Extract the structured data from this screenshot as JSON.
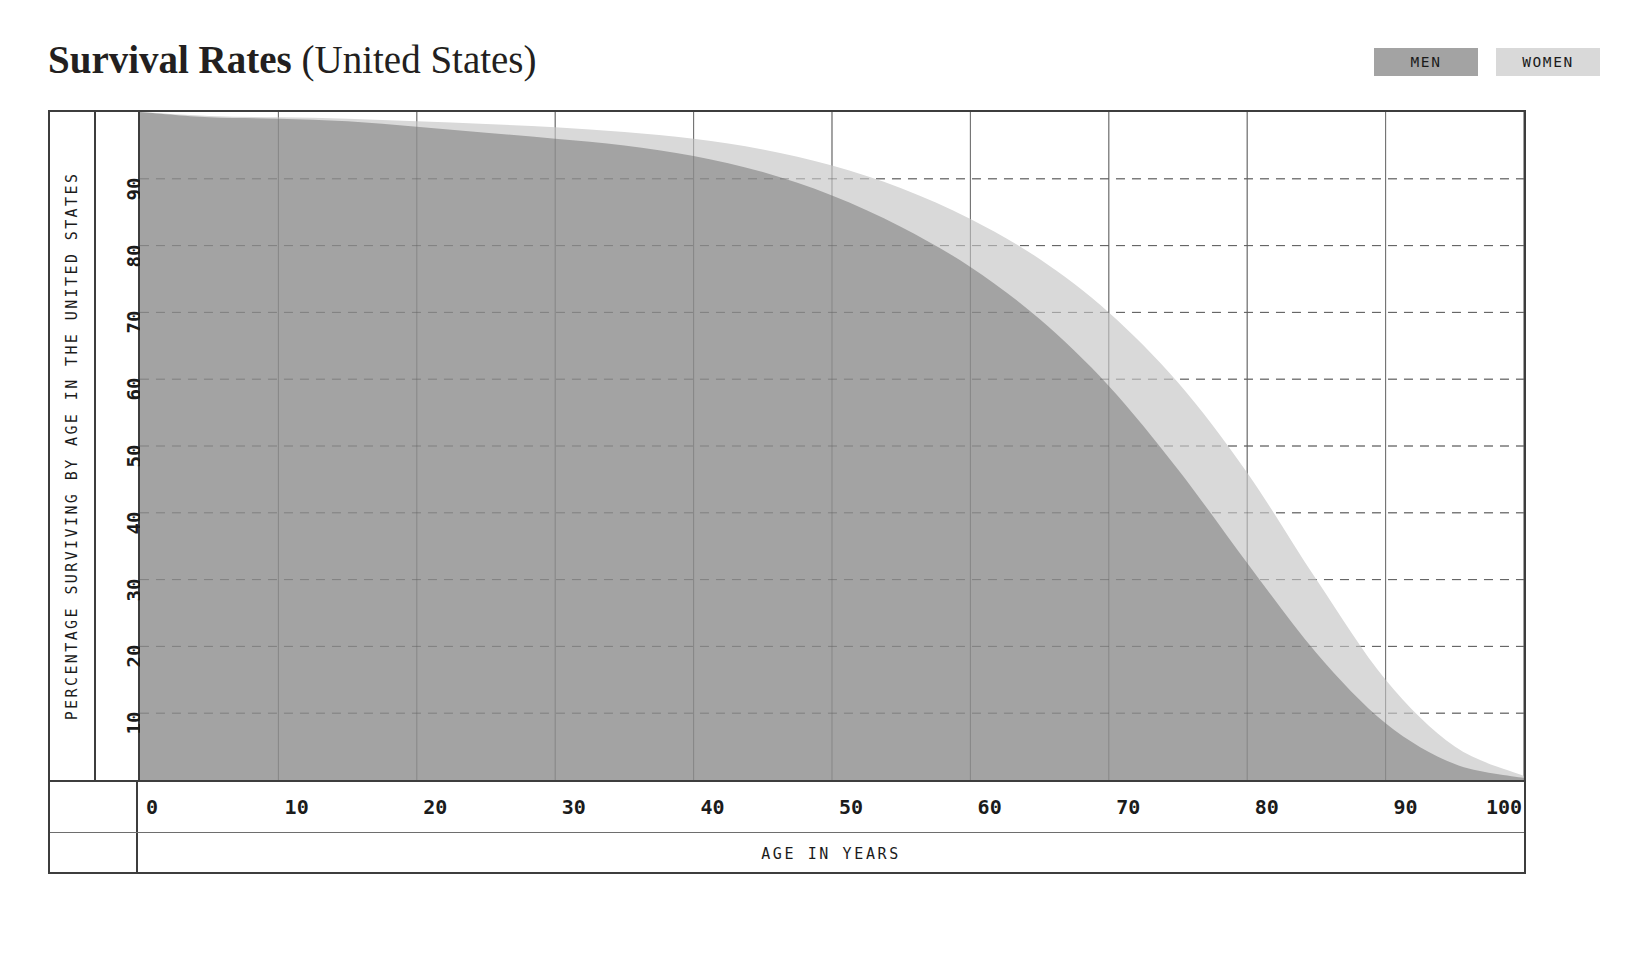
{
  "header": {
    "title_bold": "Survival Rates",
    "title_regular": " (United States)"
  },
  "legend": {
    "position": "top-right",
    "items": [
      {
        "label": "MEN",
        "color": "#a3a3a3"
      },
      {
        "label": "WOMEN",
        "color": "#d9d9d9"
      }
    ]
  },
  "axes": {
    "y_title": "PERCENTAGE SURVIVING BY AGE IN THE UNITED STATES",
    "x_title": "AGE IN YEARS",
    "y_ticks": [
      "10",
      "20",
      "30",
      "40",
      "50",
      "60",
      "70",
      "80",
      "90"
    ],
    "x_ticks": [
      "0",
      "10",
      "20",
      "30",
      "40",
      "50",
      "60",
      "70",
      "80",
      "90",
      "100"
    ]
  },
  "chart_data": {
    "type": "area",
    "title": "Survival Rates (United States)",
    "xlabel": "AGE IN YEARS",
    "ylabel": "PERCENTAGE SURVIVING BY AGE IN THE UNITED STATES",
    "xlim": [
      0,
      100
    ],
    "ylim": [
      0,
      100
    ],
    "xticks": [
      0,
      10,
      20,
      30,
      40,
      50,
      60,
      70,
      80,
      90,
      100
    ],
    "yticks": [
      10,
      20,
      30,
      40,
      50,
      60,
      70,
      80,
      90
    ],
    "grid": "solid vertical gridlines, dashed horizontal gridlines",
    "legend_position": "top-right",
    "x": [
      0,
      5,
      10,
      15,
      20,
      25,
      30,
      35,
      40,
      45,
      50,
      55,
      60,
      65,
      70,
      75,
      80,
      85,
      90,
      95,
      100
    ],
    "series": [
      {
        "name": "WOMEN",
        "color": "#d9d9d9",
        "values": [
          100,
          99.4,
          99.2,
          99.0,
          98.6,
          98.2,
          97.7,
          97.0,
          96.0,
          94.4,
          92.0,
          88.6,
          84.0,
          78.0,
          70.0,
          59.5,
          46.0,
          30.0,
          15.0,
          5.0,
          0.6
        ]
      },
      {
        "name": "MEN",
        "color": "#a3a3a3",
        "values": [
          100,
          99.2,
          99.0,
          98.6,
          97.8,
          96.9,
          96.0,
          95.0,
          93.4,
          91.0,
          87.5,
          82.8,
          76.8,
          69.0,
          59.0,
          46.5,
          32.5,
          19.0,
          8.5,
          2.4,
          0.3
        ]
      }
    ]
  }
}
